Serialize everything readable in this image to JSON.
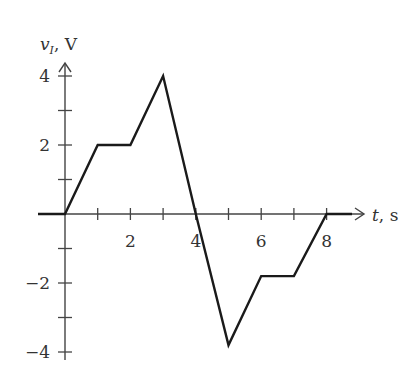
{
  "chart_data": {
    "type": "line",
    "title": "",
    "xlabel": "t, s",
    "ylabel": "v_I, V",
    "ylabel_parts": {
      "var": "v",
      "sub": "I",
      "unit": ", V"
    },
    "xlabel_parts": {
      "var": "t",
      "unit": ", s"
    },
    "x": [
      -1,
      0,
      1,
      2,
      3,
      4,
      5,
      6,
      7,
      8,
      9
    ],
    "series": [
      {
        "name": "v_I",
        "values": [
          0,
          0,
          2,
          2,
          4,
          0,
          -3.8,
          -1.8,
          -1.8,
          0,
          0
        ]
      }
    ],
    "xlim": [
      -1,
      9
    ],
    "ylim": [
      -4.3,
      4.5
    ],
    "x_ticks": [
      1,
      2,
      3,
      4,
      5,
      6,
      7,
      8
    ],
    "x_tick_labels": [
      "2",
      "4",
      "6",
      "8"
    ],
    "x_tick_label_values": [
      2,
      4,
      6,
      8
    ],
    "y_ticks": [
      -4,
      -3,
      -2,
      -1,
      1,
      2,
      3,
      4
    ],
    "y_tick_labels": [
      "4",
      "2",
      "−2",
      "−4"
    ],
    "y_tick_label_values": [
      4,
      2,
      -2,
      -4
    ],
    "grid": false,
    "legend": "none"
  }
}
